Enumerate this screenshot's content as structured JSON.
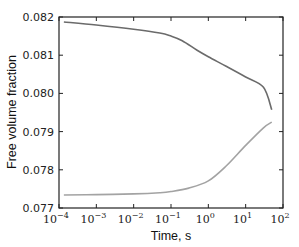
{
  "chart_data": {
    "type": "line",
    "title": "",
    "xlabel": "Time, s",
    "ylabel": "Free volume fraction",
    "xscale": "log",
    "xlim": [
      0.0001,
      100
    ],
    "ylim": [
      0.077,
      0.082
    ],
    "grid": false,
    "legend": null,
    "xticks": [
      {
        "value": 0.0001,
        "base": "10",
        "exp": "−4"
      },
      {
        "value": 0.001,
        "base": "10",
        "exp": "−3"
      },
      {
        "value": 0.01,
        "base": "10",
        "exp": "−2"
      },
      {
        "value": 0.1,
        "base": "10",
        "exp": "−1"
      },
      {
        "value": 1,
        "base": "10",
        "exp": "0"
      },
      {
        "value": 10,
        "base": "10",
        "exp": "1"
      },
      {
        "value": 100,
        "base": "10",
        "exp": "2"
      }
    ],
    "yticks": [
      {
        "value": 0.077,
        "label": "0.077"
      },
      {
        "value": 0.078,
        "label": "0.078"
      },
      {
        "value": 0.079,
        "label": "0.079"
      },
      {
        "value": 0.08,
        "label": "0.080"
      },
      {
        "value": 0.081,
        "label": "0.081"
      },
      {
        "value": 0.082,
        "label": "0.082"
      }
    ],
    "series": [
      {
        "name": "upper",
        "color": "#6b6b6b",
        "x": [
          0.000135,
          0.001,
          0.01,
          0.05,
          0.1,
          0.2,
          0.5,
          1,
          3,
          10,
          30,
          50
        ],
        "y": [
          0.08187,
          0.08179,
          0.08168,
          0.08158,
          0.0815,
          0.08138,
          0.08113,
          0.08096,
          0.08071,
          0.08043,
          0.08016,
          0.07957
        ]
      },
      {
        "name": "lower",
        "color": "#a3a3a3",
        "x": [
          0.000135,
          0.001,
          0.01,
          0.05,
          0.1,
          0.3,
          1,
          3,
          10,
          30,
          50
        ],
        "y": [
          0.07734,
          0.07735,
          0.07737,
          0.0774,
          0.07743,
          0.07752,
          0.07771,
          0.0781,
          0.07864,
          0.0791,
          0.07925
        ]
      }
    ]
  }
}
